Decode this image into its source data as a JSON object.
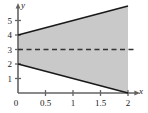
{
  "chart_data": {
    "type": "area",
    "title": "",
    "xlabel": "x",
    "ylabel": "y",
    "xlim": [
      0,
      2.15
    ],
    "ylim": [
      0,
      6.5
    ],
    "grid": false,
    "legend": "none",
    "x_ticks": [
      {
        "value": 0,
        "label": "0"
      },
      {
        "value": 0.5,
        "label": "0.5"
      },
      {
        "value": 1,
        "label": "1"
      },
      {
        "value": 1.5,
        "label": "1.5"
      },
      {
        "value": 2,
        "label": "2"
      }
    ],
    "y_ticks": [
      {
        "value": 1,
        "label": "1"
      },
      {
        "value": 2,
        "label": "2"
      },
      {
        "value": 3,
        "label": "3"
      },
      {
        "value": 4,
        "label": "4"
      },
      {
        "value": 5,
        "label": "5"
      }
    ],
    "series": [
      {
        "name": "upper boundary",
        "type": "line",
        "style": "solid",
        "color": "#1a1a1a",
        "x": [
          0,
          2
        ],
        "values": [
          4,
          6
        ]
      },
      {
        "name": "lower boundary",
        "type": "line",
        "style": "solid",
        "color": "#1a1a1a",
        "x": [
          0,
          2
        ],
        "values": [
          2,
          0
        ]
      },
      {
        "name": "reference line",
        "type": "line",
        "style": "dashed",
        "color": "#333333",
        "x": [
          0,
          2.1
        ],
        "values": [
          3,
          3
        ]
      }
    ],
    "shaded_region": {
      "name": "region between boundaries",
      "fill_color": "#c9c9c9",
      "upper_series": "upper boundary",
      "lower_series": "lower boundary",
      "x_start": 0,
      "x_end": 2
    },
    "axis_color": "#555555",
    "annotations": []
  }
}
